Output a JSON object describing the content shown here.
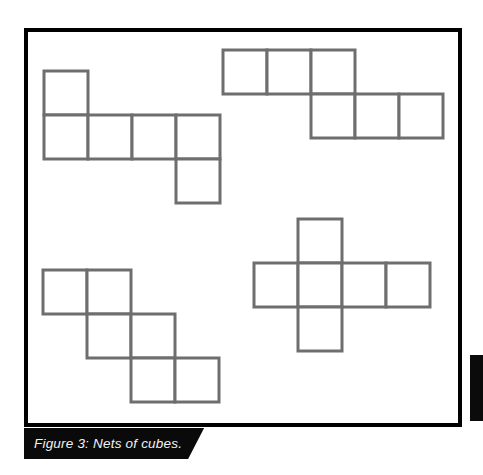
{
  "figure": {
    "caption": "Figure 3: Nets of cubes.",
    "caption_banner_color": "#0a0a0a",
    "caption_text_color": "#f2f2f2",
    "frame_color": "#000000",
    "background_color": "#ffffff"
  },
  "diagram_data": {
    "type": "diagram",
    "subject": "nets-of-cubes",
    "stroke_color": "#6e6e6e",
    "stroke_width": 3,
    "fill_color": "#ffffff",
    "cell_size": 44,
    "net_count": 4,
    "nets": [
      {
        "id": "net-top-left",
        "label": "net-1",
        "origin": {
          "x": 44,
          "y": 71
        },
        "cells": [
          {
            "col": 0,
            "row": 0
          },
          {
            "col": 0,
            "row": 1
          },
          {
            "col": 1,
            "row": 1
          },
          {
            "col": 2,
            "row": 1
          },
          {
            "col": 3,
            "row": 1
          },
          {
            "col": 3,
            "row": 2
          }
        ]
      },
      {
        "id": "net-top-right",
        "label": "net-2",
        "origin": {
          "x": 223,
          "y": 50
        },
        "cells": [
          {
            "col": 0,
            "row": 0
          },
          {
            "col": 1,
            "row": 0
          },
          {
            "col": 2,
            "row": 0
          },
          {
            "col": 2,
            "row": 1
          },
          {
            "col": 3,
            "row": 1
          },
          {
            "col": 4,
            "row": 1
          }
        ]
      },
      {
        "id": "net-bottom-left",
        "label": "net-3",
        "origin": {
          "x": 43,
          "y": 270
        },
        "cells": [
          {
            "col": 0,
            "row": 0
          },
          {
            "col": 1,
            "row": 0
          },
          {
            "col": 1,
            "row": 1
          },
          {
            "col": 2,
            "row": 1
          },
          {
            "col": 2,
            "row": 2
          },
          {
            "col": 3,
            "row": 2
          }
        ]
      },
      {
        "id": "net-bottom-right-cross",
        "label": "net-4",
        "origin": {
          "x": 254,
          "y": 219
        },
        "cells": [
          {
            "col": 1,
            "row": 0
          },
          {
            "col": 0,
            "row": 1
          },
          {
            "col": 1,
            "row": 1
          },
          {
            "col": 2,
            "row": 1
          },
          {
            "col": 3,
            "row": 1
          },
          {
            "col": 1,
            "row": 2
          }
        ]
      }
    ]
  }
}
